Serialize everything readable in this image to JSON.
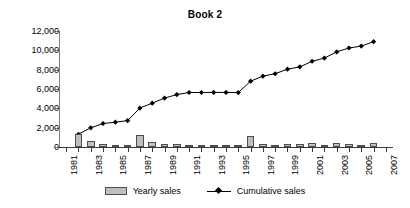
{
  "chart_data": {
    "type": "bar",
    "title": "Book 2",
    "xlabel": "",
    "ylabel": "",
    "grid": false,
    "legend_position": "bottom",
    "xlim": [
      1981,
      2007
    ],
    "ylim": [
      0,
      12000
    ],
    "x_tick_labels": [
      "1981",
      "1983",
      "1985",
      "1987",
      "1989",
      "1991",
      "1993",
      "1995",
      "1997",
      "1999",
      "2001",
      "2003",
      "2005",
      "2007"
    ],
    "y_tick_labels": [
      "0",
      "2,000",
      "4,000",
      "6,000",
      "8,000",
      "10,000",
      "12,000"
    ],
    "y_tick_values": [
      0,
      2000,
      4000,
      6000,
      8000,
      10000,
      12000
    ],
    "categories": [
      1981,
      1982,
      1983,
      1984,
      1985,
      1986,
      1987,
      1988,
      1989,
      1990,
      1991,
      1992,
      1993,
      1994,
      1995,
      1996,
      1997,
      1998,
      1999,
      2000,
      2001,
      2002,
      2003,
      2004,
      2005,
      2006,
      2007
    ],
    "series": [
      {
        "name": "Yearly sales",
        "type": "bar",
        "color": "#bfbfbf",
        "edge_color": "#4d4d4d",
        "values": [
          0,
          1300,
          650,
          330,
          160,
          140,
          1280,
          500,
          290,
          290,
          150,
          40,
          30,
          30,
          30,
          1150,
          300,
          220,
          330,
          280,
          400,
          260,
          440,
          360,
          100,
          400,
          0
        ]
      },
      {
        "name": "Cumulative sales",
        "type": "line",
        "color": "#000000",
        "marker": "diamond",
        "x": [
          1982,
          1983,
          1984,
          1985,
          1986,
          1987,
          1988,
          1989,
          1990,
          1991,
          1992,
          1993,
          1994,
          1995,
          1996,
          1997,
          1998,
          1999,
          2000,
          2001,
          2002,
          2003,
          2004,
          2005,
          2006
        ],
        "values": [
          1320,
          1980,
          2430,
          2570,
          2730,
          4030,
          4530,
          5060,
          5420,
          5640,
          5640,
          5650,
          5650,
          5630,
          6810,
          7330,
          7580,
          8050,
          8290,
          8870,
          9200,
          9840,
          10240,
          10440,
          10900
        ]
      }
    ]
  },
  "legend": {
    "items": [
      {
        "label": "Yearly sales",
        "swatch": "bar-swatch"
      },
      {
        "label": "Cumulative sales",
        "swatch": "line-marker-swatch"
      }
    ]
  }
}
